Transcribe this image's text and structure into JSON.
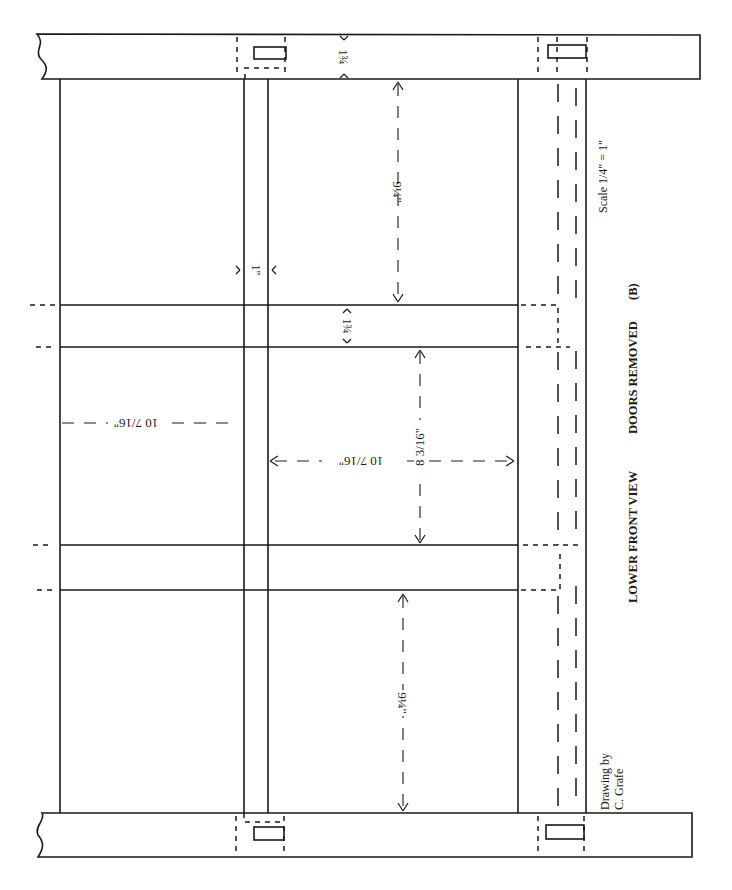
{
  "drawing": {
    "title": "LOWER FRONT VIEW",
    "subtitle": "DOORS REMOVED",
    "label": "(B)",
    "scale": "Scale 1/4\" = 1\"",
    "credit_line1": "Drawing by",
    "credit_line2": "C. Grafe"
  },
  "dimensions": {
    "rail_width_top": "1¾",
    "stile_width": "1\"",
    "upper_opening": "9¼\"",
    "shelf_thickness": "1¾",
    "middle_opening_height": "8 3/16\"",
    "middle_opening_width": "10 7/16\"",
    "left_opening_width": "10 7/16\"",
    "lower_opening": "9¼\""
  }
}
